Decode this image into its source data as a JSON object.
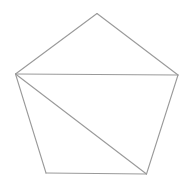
{
  "diagram": {
    "type": "polygon-triangulation",
    "shape": "pentagon",
    "stroke_color": "#9a9a9a",
    "stroke_width": 1.1,
    "background": "#ffffff",
    "vertices": {
      "top": [
        97,
        13.5
      ],
      "left": [
        15.5,
        74
      ],
      "right": [
        178,
        75
      ],
      "bottom_right": [
        146.5,
        174
      ],
      "bottom_left": [
        46,
        173
      ]
    },
    "edges": [
      {
        "from": "top",
        "to": "right"
      },
      {
        "from": "right",
        "to": "bottom_right"
      },
      {
        "from": "bottom_right",
        "to": "bottom_left"
      },
      {
        "from": "bottom_left",
        "to": "left"
      },
      {
        "from": "left",
        "to": "top"
      }
    ],
    "diagonals": [
      {
        "from": "left",
        "to": "right"
      },
      {
        "from": "left",
        "to": "bottom_right"
      }
    ]
  }
}
